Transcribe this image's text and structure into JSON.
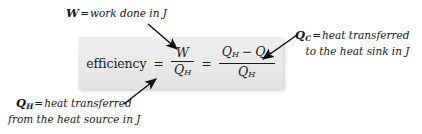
{
  "diagram": {
    "background_color": "#ffffff",
    "panel_color": "#e9e9e9",
    "text_color": "#141414"
  },
  "equation": {
    "left_term": "efficiency",
    "equals_1": "=",
    "equals_2": "=",
    "fraction_1": {
      "numerator_symbol": "W",
      "denominator_symbol": "Q",
      "denominator_subscript": "H"
    },
    "fraction_2": {
      "numerator_first_symbol": "Q",
      "numerator_first_subscript": "H",
      "numerator_operator": "−",
      "numerator_second_symbol": "Q",
      "numerator_second_subscript": "C",
      "denominator_symbol": "Q",
      "denominator_subscript": "H"
    }
  },
  "annotations": {
    "work": {
      "symbol": "W",
      "subscript": "",
      "equals": "=",
      "line1": "work done in J",
      "line2": ""
    },
    "heat_cold": {
      "symbol": "Q",
      "subscript": "C",
      "equals": "=",
      "line1": "heat transferred",
      "line2": "to the heat sink in J"
    },
    "heat_hot": {
      "symbol": "Q",
      "subscript": "H",
      "equals": "=",
      "line1": "heat transferred",
      "line2": "from the heat source in J"
    }
  },
  "arrows": [
    {
      "name": "arrow-work-to-numerator",
      "from": [
        148,
        24
      ],
      "to": [
        178,
        50
      ]
    },
    {
      "name": "arrow-qc-to-numerator",
      "from": [
        296,
        35
      ],
      "to": [
        262,
        60
      ]
    },
    {
      "name": "arrow-qh-to-denominator",
      "from": [
        124,
        104
      ],
      "to": [
        157,
        78
      ]
    }
  ]
}
